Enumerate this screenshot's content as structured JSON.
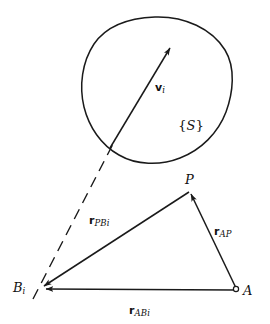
{
  "figure": {
    "type": "vector-kinematics-diagram",
    "background_color": "#ffffff",
    "stroke_color": "#1a1a1a",
    "text_color": "#111111"
  },
  "body_region": {
    "name": "rigid-body-outline",
    "frame_label": {
      "open_brace": "{",
      "symbol": "S",
      "close_brace": "}"
    }
  },
  "vectors": {
    "velocity": {
      "symbol": "v",
      "subscript": "i",
      "from": [
        110,
        148
      ],
      "to": [
        172,
        45
      ]
    },
    "r_pbi": {
      "symbol": "r",
      "subscript": "PBi",
      "from": [
        190,
        190
      ],
      "to": [
        38,
        288
      ]
    },
    "r_ap": {
      "symbol": "r",
      "subscript": "AP",
      "from": [
        238,
        290
      ],
      "to": [
        190,
        190
      ]
    },
    "r_abi": {
      "symbol": "r",
      "subscript": "ABi",
      "from": [
        238,
        290
      ],
      "to": [
        38,
        288
      ]
    }
  },
  "points": {
    "p": {
      "symbol": "P",
      "subscript": "",
      "x": 190,
      "y": 190
    },
    "b_i": {
      "symbol": "B",
      "subscript": "i",
      "x": 38,
      "y": 288
    },
    "a": {
      "symbol": "A",
      "subscript": "",
      "x": 238,
      "y": 290
    }
  },
  "dashed_ray": {
    "name": "velocity-axis-dashed-line",
    "from": [
      38,
      288
    ],
    "to": [
      112,
      145
    ]
  }
}
